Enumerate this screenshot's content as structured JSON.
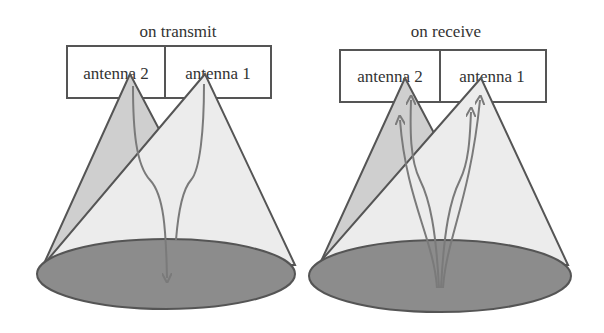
{
  "panels": [
    {
      "title": "on transmit",
      "antennas": [
        {
          "label": "antenna 2"
        },
        {
          "label": "antenna 1"
        }
      ],
      "arrow_direction": "down"
    },
    {
      "title": "on receive",
      "antennas": [
        {
          "label": "antenna 2"
        },
        {
          "label": "antenna 1"
        }
      ],
      "arrow_direction": "up"
    }
  ],
  "colors": {
    "outline": "#555555",
    "ground": "#8c8c8c",
    "cone_back": "#cfcfcf",
    "cone_front": "#ececec",
    "arrow": "#7a7a7a"
  }
}
